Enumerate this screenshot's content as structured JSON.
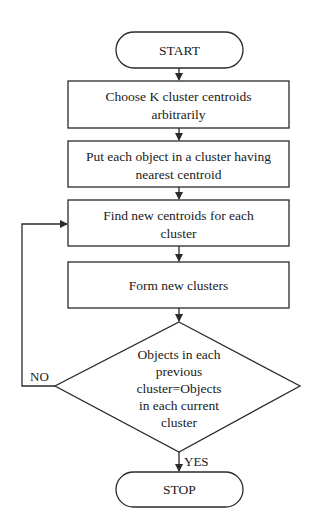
{
  "diagram": {
    "type": "flowchart",
    "colors": {
      "stroke": "#2a2a2a",
      "fill": "#ffffff",
      "text": "#1a1a1a"
    },
    "nodes": {
      "start": {
        "shape": "terminator",
        "lines": [
          "START"
        ]
      },
      "choose": {
        "shape": "process",
        "lines": [
          "Choose K cluster centroids",
          "arbitrarily"
        ]
      },
      "assign": {
        "shape": "process",
        "lines": [
          "Put each object in a cluster having",
          "nearest centroid"
        ]
      },
      "find": {
        "shape": "process",
        "lines": [
          "Find new centroids for each",
          "cluster"
        ]
      },
      "form": {
        "shape": "process",
        "lines": [
          "Form new clusters"
        ]
      },
      "decision": {
        "shape": "decision",
        "lines": [
          "Objects in each",
          "previous",
          "cluster=Objects",
          "in each current",
          "cluster"
        ]
      },
      "stop": {
        "shape": "terminator",
        "lines": [
          "STOP"
        ]
      }
    },
    "edges": {
      "no_label": "NO",
      "yes_label": "YES"
    }
  }
}
